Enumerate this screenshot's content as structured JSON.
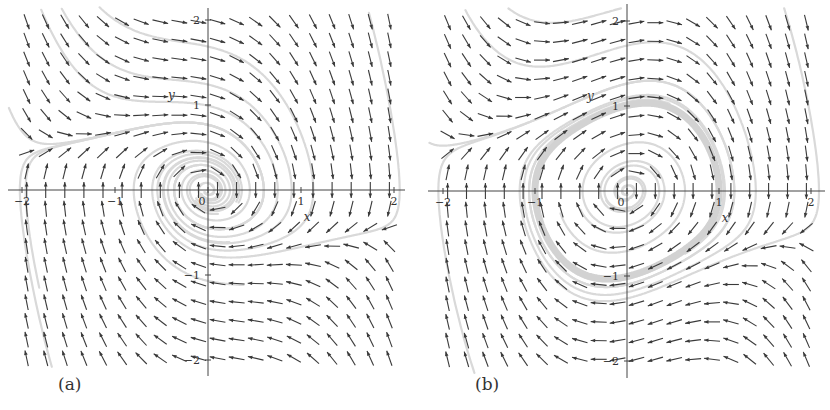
{
  "chart_data": [
    {
      "type": "quiver",
      "panel_label": "(a)",
      "title": "",
      "xlabel": "x",
      "ylabel": "y",
      "xlim": [
        -2,
        2
      ],
      "ylim": [
        -2,
        2
      ],
      "x_ticks": [
        -2,
        -1,
        0,
        1,
        2
      ],
      "y_ticks": [
        -2,
        -1,
        1,
        2
      ],
      "x_tick_labels": [
        "-2",
        "-1",
        "0",
        "1",
        "2"
      ],
      "y_tick_labels": [
        "-2",
        "-1",
        "1",
        "2"
      ],
      "grid": false,
      "field": {
        "equation_x": "dx/dt = y",
        "equation_y": "dy/dt = -x + mu*(a - x^2)*y",
        "mu": 1.0,
        "a": -0.25,
        "normalized_arrows": true,
        "arrow_color": "#3a3a3a",
        "grid_cols": 20,
        "grid_rows": 19
      },
      "streamlines": {
        "color": "#d9d9d9",
        "width": 2.2,
        "seeds": [
          [
            0.15,
            0.0
          ],
          [
            0.3,
            0.0
          ],
          [
            0.45,
            0.0
          ],
          [
            0.6,
            0.0
          ],
          [
            0.75,
            0.0
          ],
          [
            0.9,
            0.0
          ],
          [
            -1.8,
            0.55
          ],
          [
            1.75,
            2.0
          ],
          [
            -1.7,
            -2.0
          ],
          [
            -1.0,
            2.0
          ]
        ],
        "limit_cycle": false
      },
      "notes": "Stable focus at origin; trajectories spiral into (0,0)."
    },
    {
      "type": "quiver",
      "panel_label": "(b)",
      "title": "",
      "xlabel": "x",
      "ylabel": "y",
      "xlim": [
        -2,
        2
      ],
      "ylim": [
        -2,
        2
      ],
      "x_ticks": [
        -2,
        -1,
        0,
        1,
        2
      ],
      "y_ticks": [
        -2,
        -1,
        1,
        2
      ],
      "x_tick_labels": [
        "-2",
        "-1",
        "0",
        "1",
        "2"
      ],
      "y_tick_labels": [
        "-2",
        "-1",
        "1",
        "2"
      ],
      "grid": false,
      "field": {
        "equation_x": "dx/dt = y",
        "equation_y": "dy/dt = -x + mu*(a - x^2)*y",
        "mu": 1.0,
        "a": 0.25,
        "normalized_arrows": true,
        "arrow_color": "#3a3a3a",
        "grid_cols": 20,
        "grid_rows": 19
      },
      "streamlines": {
        "color": "#d9d9d9",
        "width": 2.2,
        "seeds": [
          [
            0.08,
            0.0
          ],
          [
            0.2,
            0.0
          ],
          [
            0.35,
            0.0
          ],
          [
            1.4,
            0.0
          ],
          [
            -1.85,
            0.55
          ],
          [
            1.75,
            2.0
          ],
          [
            -1.7,
            -2.0
          ],
          [
            -1.0,
            2.0
          ]
        ],
        "limit_cycle": true,
        "limit_cycle_color": "#d2d2d2",
        "limit_cycle_width": 7
      },
      "notes": "Unstable focus at origin surrounded by a stable limit cycle of radius about 1."
    }
  ],
  "panels": {
    "a": {
      "caption": "(a)",
      "x_axis_label": "x",
      "y_axis_label": "y",
      "origin_label": "0"
    },
    "b": {
      "caption": "(b)",
      "x_axis_label": "x",
      "y_axis_label": "y",
      "origin_label": "0"
    }
  }
}
